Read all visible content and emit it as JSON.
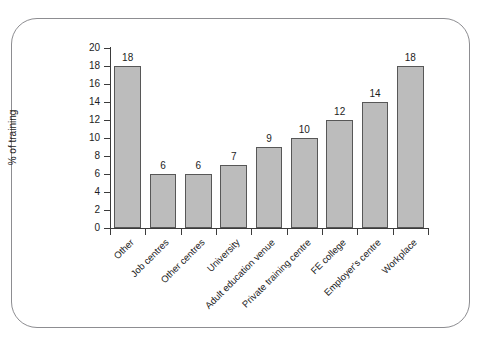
{
  "caption_remnant": "",
  "figure": {
    "frame_border_color": "#8d8d91",
    "background_color": "#ffffff"
  },
  "chart_data": {
    "type": "bar",
    "title": "",
    "xlabel": "",
    "ylabel": "% of training",
    "categories": [
      "Other",
      "Job centres",
      "Other centres",
      "University",
      "Adult education venue",
      "Private training centre",
      "FE college",
      "Employer's centre",
      "Workplace"
    ],
    "values": [
      18,
      6,
      6,
      7,
      9,
      10,
      12,
      14,
      18
    ],
    "value_labels": [
      "18",
      "6",
      "6",
      "7",
      "9",
      "10",
      "12",
      "14",
      "18"
    ],
    "ylim": [
      0,
      20
    ],
    "ytick_values": [
      0,
      2,
      4,
      6,
      8,
      10,
      12,
      14,
      16,
      18,
      20
    ],
    "ytick_labels": [
      "0",
      "2",
      "4",
      "6",
      "8",
      "10",
      "12",
      "14",
      "16",
      "18",
      "20"
    ],
    "grid": false,
    "legend": false,
    "legend_position": "none",
    "bar_fill_color": "#bcbcbc",
    "bar_edge_color": "#575757",
    "axis_color": "#3b3b3b",
    "xtick_label_rotation": -45
  }
}
